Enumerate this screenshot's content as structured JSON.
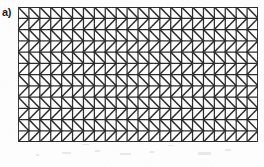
{
  "figure": {
    "panel_label": "a)",
    "caption": "",
    "kind": "finite-element-mesh-diagram",
    "medium": "scanned-print"
  },
  "mesh": {
    "name": "triangular-finite-element-mesh",
    "shape": "rectangle",
    "columns": 22,
    "rows": 12,
    "cell_width_px": 10.91,
    "cell_height_px": 11.25,
    "x_px": 18,
    "y_px": 7,
    "width_px": 240,
    "height_px": 135,
    "diagonal_pattern": "alternating-by-row",
    "row_diagonals": [
      "backslash",
      "slash",
      "backslash",
      "slash",
      "backslash",
      "slash",
      "backslash",
      "slash",
      "backslash",
      "slash",
      "backslash",
      "slash"
    ],
    "element_type": "triangle",
    "element_count": 528,
    "node_count": 299
  },
  "colors": {
    "background": "#fdfdfd",
    "line": "#2b2b2b",
    "border": "#1a1a1a",
    "label": "#1a1a1a",
    "grain": "#b8b8b8"
  },
  "chart_data": {
    "type": "diagram",
    "title": "a)",
    "xlabel": "",
    "ylabel": "",
    "grid_columns": 22,
    "grid_rows": 12
  }
}
